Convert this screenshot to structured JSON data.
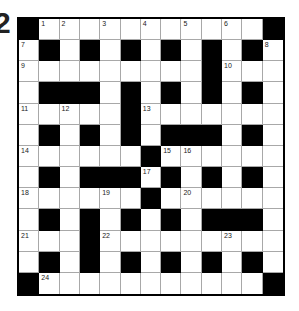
{
  "question_number": "2",
  "colors": {
    "block": "#000000",
    "cell": "#ffffff",
    "gridline": "#a8a8a8"
  },
  "grid": {
    "rows": 13,
    "cols": 13,
    "layout": [
      "#............#",
      "",
      "",
      "",
      "",
      "",
      "",
      "",
      "",
      "",
      "",
      "",
      ""
    ],
    "pattern": [
      "#...........#",
      ".#.#.#.#.#.#.",
      ".........#...",
      ".###.#.#.#.#.",
      ".....#.......",
      ".#.#.#.###.#.",
      "......#......",
      ".#.###.#.#.#.",
      "......#......",
      ".#.#.#.#.###.",
      "...#.........",
      ".#.#.#.#.#.#.",
      "#...........#"
    ],
    "numbers": [
      {
        "r": 0,
        "c": 1,
        "n": "1"
      },
      {
        "r": 0,
        "c": 2,
        "n": "2"
      },
      {
        "r": 0,
        "c": 4,
        "n": "3"
      },
      {
        "r": 0,
        "c": 6,
        "n": "4"
      },
      {
        "r": 0,
        "c": 8,
        "n": "5"
      },
      {
        "r": 0,
        "c": 10,
        "n": "6"
      },
      {
        "r": 1,
        "c": 0,
        "n": "7"
      },
      {
        "r": 1,
        "c": 12,
        "n": "8"
      },
      {
        "r": 2,
        "c": 0,
        "n": "9"
      },
      {
        "r": 2,
        "c": 10,
        "n": "10"
      },
      {
        "r": 4,
        "c": 0,
        "n": "11"
      },
      {
        "r": 4,
        "c": 2,
        "n": "12"
      },
      {
        "r": 4,
        "c": 6,
        "n": "13"
      },
      {
        "r": 6,
        "c": 0,
        "n": "14"
      },
      {
        "r": 6,
        "c": 7,
        "n": "15"
      },
      {
        "r": 6,
        "c": 8,
        "n": "16"
      },
      {
        "r": 7,
        "c": 6,
        "n": "17"
      },
      {
        "r": 8,
        "c": 0,
        "n": "18"
      },
      {
        "r": 8,
        "c": 4,
        "n": "19"
      },
      {
        "r": 8,
        "c": 8,
        "n": "20"
      },
      {
        "r": 10,
        "c": 0,
        "n": "21"
      },
      {
        "r": 10,
        "c": 4,
        "n": "22"
      },
      {
        "r": 10,
        "c": 10,
        "n": "23"
      },
      {
        "r": 12,
        "c": 1,
        "n": "24"
      }
    ]
  }
}
